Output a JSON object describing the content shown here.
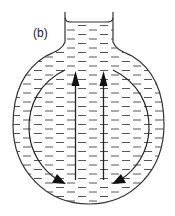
{
  "figure": {
    "label": "(b)",
    "colors": {
      "line": "#333333",
      "dash": "#555555",
      "background": "#ffffff"
    },
    "arrows": [
      {
        "id": "up-left",
        "direction": "up"
      },
      {
        "id": "up-right",
        "direction": "up"
      },
      {
        "id": "curve-left",
        "direction": "down-around"
      },
      {
        "id": "curve-right",
        "direction": "down-around"
      }
    ]
  }
}
